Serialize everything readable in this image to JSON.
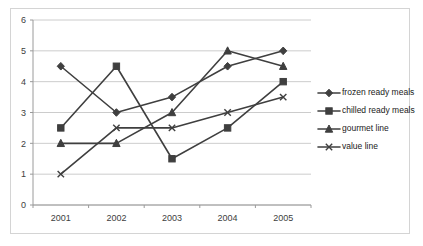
{
  "chart_data": {
    "type": "line",
    "title": "",
    "xlabel": "",
    "ylabel": "",
    "categories": [
      "2001",
      "2002",
      "2003",
      "2004",
      "2005"
    ],
    "x": [
      2001,
      2002,
      2003,
      2004,
      2005
    ],
    "ylim": [
      0,
      6
    ],
    "yticks": [
      "0",
      "1",
      "2",
      "3",
      "4",
      "5",
      "6"
    ],
    "grid": true,
    "legend_position": "right",
    "series": [
      {
        "name": "frozen ready meals",
        "marker": "diamond",
        "color": "#3f3f3f",
        "values": [
          4.5,
          3.0,
          3.5,
          4.5,
          5.0
        ]
      },
      {
        "name": "chilled ready meals",
        "marker": "square",
        "color": "#3f3f3f",
        "values": [
          2.5,
          4.5,
          1.5,
          2.5,
          4.0
        ]
      },
      {
        "name": "gourmet line",
        "marker": "triangle",
        "color": "#3f3f3f",
        "values": [
          2.0,
          2.0,
          3.0,
          5.0,
          4.5
        ]
      },
      {
        "name": "value line",
        "marker": "x",
        "color": "#3f3f3f",
        "values": [
          1.0,
          2.5,
          2.5,
          3.0,
          3.5
        ]
      }
    ]
  },
  "legend": {
    "items": [
      {
        "label": "frozen ready meals"
      },
      {
        "label": "chilled ready meals"
      },
      {
        "label": "gourmet line"
      },
      {
        "label": "value line"
      }
    ]
  },
  "axes": {
    "y_tick_labels": [
      "6",
      "5",
      "4",
      "3",
      "2",
      "1",
      "0"
    ],
    "x_tick_labels": [
      "2001",
      "2002",
      "2003",
      "2004",
      "2005"
    ]
  },
  "colors": {
    "frame_border": "#d4d4d4",
    "gridline": "#bfbfbf",
    "axis": "#9a9a9a",
    "series": "#3f3f3f",
    "text": "#1a1a1a",
    "background": "#ffffff"
  }
}
